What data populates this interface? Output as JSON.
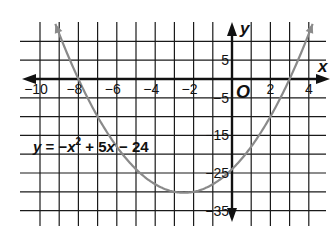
{
  "chart_data": {
    "type": "line",
    "title": "",
    "equation_label": "y = −x² + 5x − 24",
    "equation_parts": {
      "y": "y",
      "eq": " = −",
      "x": "x",
      "sup": "2",
      "rest": " + 5",
      "x2": "x",
      "tail": " − 24"
    },
    "xlabel": "x",
    "ylabel": "y",
    "origin_label": "O",
    "xlim": [
      -11,
      4.8
    ],
    "ylim": [
      -39,
      15
    ],
    "grid": true,
    "x_grid_step": 1,
    "y_grid_step": 5,
    "x_ticks": [
      {
        "value": -10,
        "label": "−10"
      },
      {
        "value": -8,
        "label": "−8"
      },
      {
        "value": -6,
        "label": "−6"
      },
      {
        "value": -4,
        "label": "−4"
      },
      {
        "value": -2,
        "label": "−2"
      },
      {
        "value": 2,
        "label": "2"
      },
      {
        "value": 4,
        "label": "4"
      }
    ],
    "y_ticks": [
      {
        "value": 5,
        "label": "5"
      },
      {
        "value": -5,
        "label": "−5"
      },
      {
        "value": -15,
        "label": "−15"
      },
      {
        "value": -25,
        "label": "−25"
      },
      {
        "value": -35,
        "label": "−35"
      }
    ],
    "series": [
      {
        "name": "parabola",
        "function": "x^2 + 5x - 24",
        "coefficients": {
          "a": 1,
          "b": 5,
          "c": -24
        },
        "x_range": [
          -9.2,
          4.2
        ],
        "roots": [
          -8,
          3
        ],
        "vertex": [
          -2.5,
          -30.25
        ],
        "y_intercept": -24,
        "color": "#8a8a8a"
      }
    ]
  },
  "colors": {
    "grid": "#1a1a1a",
    "axis": "#111111",
    "curve": "#8a8a8a",
    "background": "#ffffff"
  }
}
